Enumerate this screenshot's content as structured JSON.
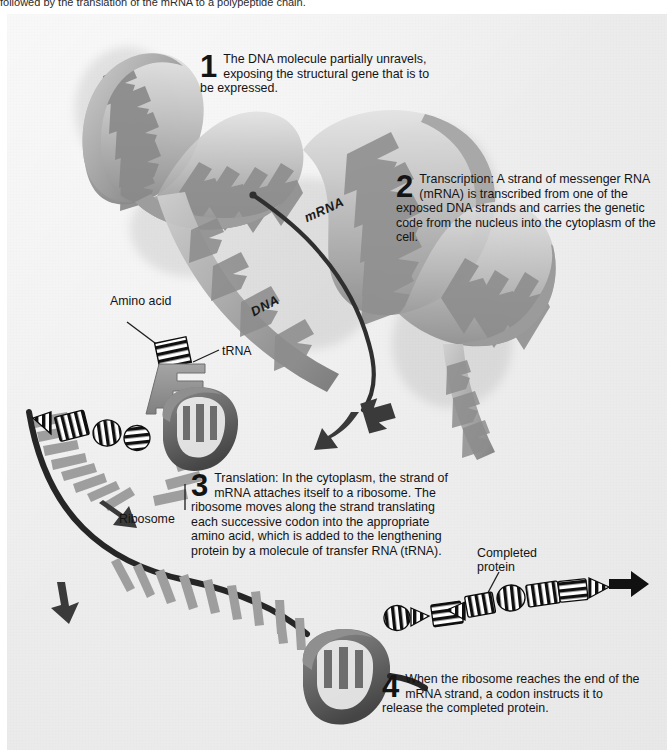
{
  "page": {
    "top_caption": "followed by the translation of the mRNA to a polypeptide chain.",
    "background": "#efefef",
    "ink": "#141414"
  },
  "steps": [
    {
      "number": "1",
      "text": "The DNA molecule partially unravels, exposing the structural gene that is to be expressed."
    },
    {
      "number": "2",
      "text": "Transcription: A strand of messenger RNA (mRNA) is transcribed from one of the exposed DNA strands and carries the genetic code from the nucleus into the cytoplasm of the cell."
    },
    {
      "number": "3",
      "text": "Translation: In the cytoplasm, the strand of mRNA attaches itself to a ribosome. The ribosome moves along the strand translating each successive codon into the appropriate amino acid, which is added to the lengthening protein by a molecule of transfer RNA (tRNA)."
    },
    {
      "number": "4",
      "text": "When the ribosome reaches the end of the mRNA strand, a codon instructs it to release the completed protein."
    }
  ],
  "labels": {
    "amino_acid": "Amino acid",
    "trna": "tRNA",
    "ribosome": "Ribosome",
    "completed_protein": "Completed protein",
    "mrna": "mRNA",
    "dna": "DNA"
  },
  "colors": {
    "helix_ribbon_light": "#d8d8d8",
    "helix_ribbon_mid": "#a9a9a9",
    "helix_ribbon_dark": "#7b7b7b",
    "base_pair": "#8f8f8f",
    "mrna_strand": "#2b2b2b",
    "mrna_base": "#9a9a9a",
    "ribosome": "#6e6e6e",
    "ribosome_dark": "#4a4a4a",
    "trna": "#8c8c8c",
    "protein_bead": "#111111",
    "arrow": "#3a3a3a"
  },
  "diagram": {
    "elements": [
      "dna-double-helix",
      "mrna-strand",
      "trna-with-amino-acid",
      "ribosome-translating",
      "ribosome-releasing",
      "completed-protein-chain",
      "flow-arrows"
    ]
  }
}
